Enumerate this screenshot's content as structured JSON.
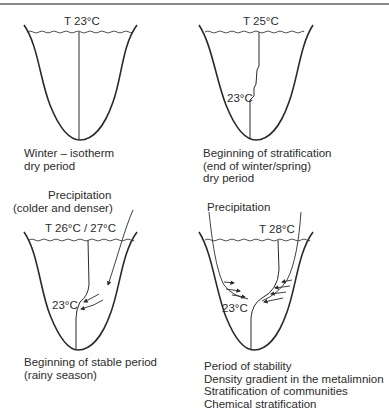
{
  "figure": {
    "panels": [
      {
        "id": "winter",
        "surface_temp": "T 23°C",
        "depth_temp": null,
        "precip_label": null,
        "caption": [
          "Winter – isotherm",
          "dry period"
        ]
      },
      {
        "id": "beginning-stratification",
        "surface_temp": "T 25°C",
        "depth_temp": "23°C",
        "precip_label": null,
        "caption": [
          "Beginning of stratification",
          "(end of winter/spring)",
          "dry period"
        ]
      },
      {
        "id": "beginning-stable",
        "surface_temp": "T 26°C / 27°C",
        "depth_temp": "23°C",
        "precip_label": [
          "Precipitation",
          "(colder and denser)"
        ],
        "caption": [
          "Beginning of stable period",
          "(rainy season)"
        ]
      },
      {
        "id": "stability",
        "surface_temp": "T 28°C",
        "depth_temp": "23°C",
        "precip_label": [
          "Precipitation"
        ],
        "caption": [
          "Period of stability",
          "Density gradient in the metalimnion",
          "Stratification of communities",
          "Chemical stratification"
        ]
      }
    ]
  },
  "colors": {
    "line": "#2a2a2a",
    "rule": "#8a8a8a",
    "background": "#ffffff"
  }
}
